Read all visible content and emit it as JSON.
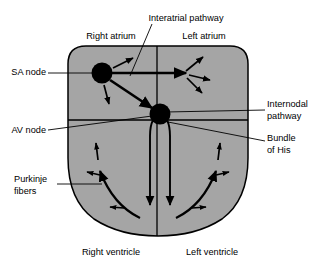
{
  "figure": {
    "type": "anatomical-diagram",
    "width": 330,
    "height": 274,
    "background_color": "#ffffff",
    "stroke_color": "#000000",
    "heart_fill_color": "#a5a5a5",
    "node_fill_color": "#000000"
  },
  "labels": {
    "interatrial_pathway": "Interatrial pathway",
    "right_atrium": "Right atrium",
    "left_atrium": "Left atrium",
    "sa_node": "SA node",
    "av_node": "AV node",
    "internodal_pathway_line1": "Internodal",
    "internodal_pathway_line2": "pathway",
    "bundle_of_his_line1": "Bundle",
    "bundle_of_his_line2": "of His",
    "purkinje_fibers_line1": "Purkinje",
    "purkinje_fibers_line2": "fibers",
    "right_ventricle": "Right ventricle",
    "left_ventricle": "Left ventricle"
  },
  "structures": [
    {
      "name": "sa-node",
      "label": "SA node",
      "kind": "node",
      "cx": 102,
      "cy": 73,
      "r": 10
    },
    {
      "name": "av-node",
      "label": "AV node",
      "kind": "node",
      "cx": 160,
      "cy": 114,
      "r": 10
    },
    {
      "name": "interatrial-pathway",
      "label": "Interatrial pathway",
      "kind": "pathway"
    },
    {
      "name": "internodal-pathway",
      "label": "Internodal pathway",
      "kind": "pathway"
    },
    {
      "name": "bundle-of-his",
      "label": "Bundle of His",
      "kind": "pathway"
    },
    {
      "name": "purkinje-fibers",
      "label": "Purkinje fibers",
      "kind": "pathway"
    },
    {
      "name": "right-atrium",
      "label": "Right atrium",
      "kind": "chamber"
    },
    {
      "name": "left-atrium",
      "label": "Left atrium",
      "kind": "chamber"
    },
    {
      "name": "right-ventricle",
      "label": "Right ventricle",
      "kind": "chamber"
    },
    {
      "name": "left-ventricle",
      "label": "Left ventricle",
      "kind": "chamber"
    }
  ]
}
